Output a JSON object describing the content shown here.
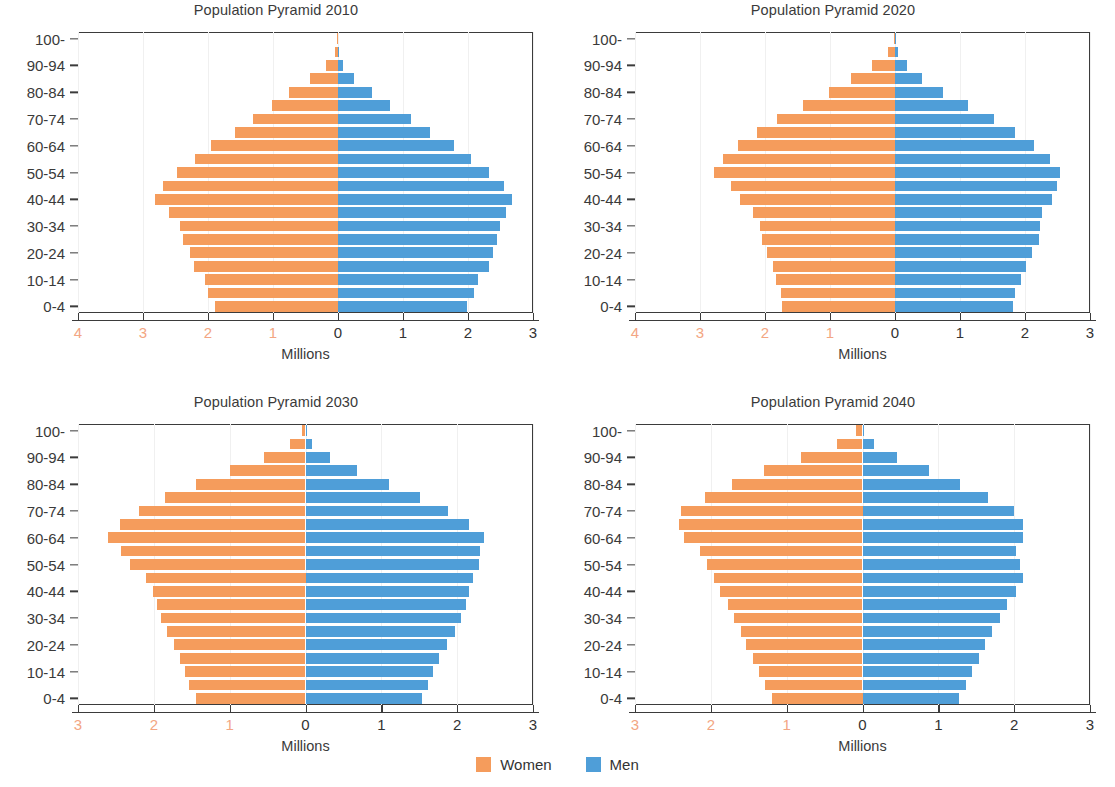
{
  "figure": {
    "legend": {
      "items": [
        {
          "label": "Women",
          "color": "#f59c5c",
          "key": "women"
        },
        {
          "label": "Men",
          "color": "#4f9ed8",
          "key": "men"
        }
      ]
    },
    "colors": {
      "women": "#f59c5c",
      "men": "#4f9ed8",
      "axis": "#3b3b3b",
      "negative_tick_label": "#f3a683",
      "positive_tick_label": "#333333",
      "text": "#3a3a3a"
    }
  },
  "chart_data": [
    {
      "type": "bar",
      "subtype": "population-pyramid",
      "title": "Population Pyramid 2010",
      "xlabel": "Millions",
      "ylabel": "",
      "grid": false,
      "legend_position": "bottom-center",
      "xlim": [
        -4,
        3
      ],
      "xticks": [
        -4,
        -3,
        -2,
        -1,
        0,
        1,
        2,
        3
      ],
      "xticklabels": [
        "4",
        "3",
        "2",
        "1",
        "0",
        "1",
        "2",
        "3"
      ],
      "categories": [
        "0-4",
        "5-9",
        "10-14",
        "15-19",
        "20-24",
        "25-29",
        "30-34",
        "35-39",
        "40-44",
        "45-49",
        "50-54",
        "55-59",
        "60-64",
        "65-69",
        "70-74",
        "75-79",
        "80-84",
        "85-89",
        "90-94",
        "95-99",
        "100+"
      ],
      "yticklabels": [
        "0-4",
        "10-14",
        "20-24",
        "30-34",
        "40-44",
        "50-54",
        "60-64",
        "70-74",
        "80-84",
        "90-94",
        "100-"
      ],
      "series": [
        {
          "name": "Women",
          "values": [
            1.9,
            2.0,
            2.05,
            2.21,
            2.28,
            2.38,
            2.43,
            2.6,
            2.81,
            2.7,
            2.48,
            2.2,
            1.95,
            1.59,
            1.31,
            1.01,
            0.76,
            0.43,
            0.18,
            0.05,
            0.01
          ]
        },
        {
          "name": "Men",
          "values": [
            1.99,
            2.09,
            2.15,
            2.32,
            2.38,
            2.45,
            2.49,
            2.59,
            2.68,
            2.56,
            2.33,
            2.05,
            1.79,
            1.42,
            1.13,
            0.8,
            0.52,
            0.24,
            0.08,
            0.02,
            0.0
          ]
        }
      ]
    },
    {
      "type": "bar",
      "subtype": "population-pyramid",
      "title": "Population Pyramid 2020",
      "xlabel": "Millions",
      "ylabel": "",
      "grid": false,
      "legend_position": "bottom-center",
      "xlim": [
        -4,
        3
      ],
      "xticks": [
        -4,
        -3,
        -2,
        -1,
        0,
        1,
        2,
        3
      ],
      "xticklabels": [
        "4",
        "3",
        "2",
        "1",
        "0",
        "1",
        "2",
        "3"
      ],
      "categories": [
        "0-4",
        "5-9",
        "10-14",
        "15-19",
        "20-24",
        "25-29",
        "30-34",
        "35-39",
        "40-44",
        "45-49",
        "50-54",
        "55-59",
        "60-64",
        "65-69",
        "70-74",
        "75-79",
        "80-84",
        "85-89",
        "90-94",
        "95-99",
        "100+"
      ],
      "yticklabels": [
        "0-4",
        "10-14",
        "20-24",
        "30-34",
        "40-44",
        "50-54",
        "60-64",
        "70-74",
        "80-84",
        "90-94",
        "100-"
      ],
      "series": [
        {
          "name": "Women",
          "values": [
            1.74,
            1.75,
            1.83,
            1.88,
            1.97,
            2.04,
            2.08,
            2.18,
            2.38,
            2.52,
            2.78,
            2.65,
            2.42,
            2.13,
            1.82,
            1.42,
            1.02,
            0.67,
            0.36,
            0.11,
            0.02
          ]
        },
        {
          "name": "Men",
          "values": [
            1.82,
            1.85,
            1.94,
            2.02,
            2.11,
            2.21,
            2.23,
            2.26,
            2.42,
            2.49,
            2.54,
            2.38,
            2.14,
            1.84,
            1.52,
            1.12,
            0.74,
            0.42,
            0.18,
            0.04,
            0.01
          ]
        }
      ]
    },
    {
      "type": "bar",
      "subtype": "population-pyramid",
      "title": "Population Pyramid 2030",
      "xlabel": "Millions",
      "ylabel": "",
      "grid": false,
      "legend_position": "bottom-center",
      "xlim": [
        -3,
        3
      ],
      "xticks": [
        -3,
        -2,
        -1,
        0,
        1,
        2,
        3
      ],
      "xticklabels": [
        "3",
        "2",
        "1",
        "0",
        "1",
        "2",
        "3"
      ],
      "categories": [
        "0-4",
        "5-9",
        "10-14",
        "15-19",
        "20-24",
        "25-29",
        "30-34",
        "35-39",
        "40-44",
        "45-49",
        "50-54",
        "55-59",
        "60-64",
        "65-69",
        "70-74",
        "75-79",
        "80-84",
        "85-89",
        "90-94",
        "95-99",
        "100+"
      ],
      "yticklabels": [
        "0-4",
        "10-14",
        "20-24",
        "30-34",
        "40-44",
        "50-54",
        "60-64",
        "70-74",
        "80-84",
        "90-94",
        "100-"
      ],
      "series": [
        {
          "name": "Women",
          "values": [
            1.44,
            1.53,
            1.59,
            1.66,
            1.74,
            1.83,
            1.9,
            1.96,
            2.01,
            2.1,
            2.31,
            2.43,
            2.61,
            2.44,
            2.19,
            1.85,
            1.45,
            0.99,
            0.55,
            0.21,
            0.04
          ]
        },
        {
          "name": "Men",
          "values": [
            1.53,
            1.62,
            1.68,
            1.76,
            1.86,
            1.97,
            2.05,
            2.11,
            2.16,
            2.21,
            2.29,
            2.3,
            2.36,
            2.16,
            1.88,
            1.51,
            1.1,
            0.68,
            0.32,
            0.09,
            0.01
          ]
        }
      ]
    },
    {
      "type": "bar",
      "subtype": "population-pyramid",
      "title": "Population Pyramid 2040",
      "xlabel": "Millions",
      "ylabel": "",
      "grid": false,
      "legend_position": "bottom-center",
      "xlim": [
        -3,
        3
      ],
      "xticks": [
        -3,
        -2,
        -1,
        0,
        1,
        2,
        3
      ],
      "xticklabels": [
        "3",
        "2",
        "1",
        "0",
        "1",
        "2",
        "3"
      ],
      "categories": [
        "0-4",
        "5-9",
        "10-14",
        "15-19",
        "20-24",
        "25-29",
        "30-34",
        "35-39",
        "40-44",
        "45-49",
        "50-54",
        "55-59",
        "60-64",
        "65-69",
        "70-74",
        "75-79",
        "80-84",
        "85-89",
        "90-94",
        "95-99",
        "100+"
      ],
      "yticklabels": [
        "0-4",
        "10-14",
        "20-24",
        "30-34",
        "40-44",
        "50-54",
        "60-64",
        "70-74",
        "80-84",
        "90-94",
        "100-"
      ],
      "series": [
        {
          "name": "Women",
          "values": [
            1.2,
            1.28,
            1.37,
            1.45,
            1.53,
            1.6,
            1.69,
            1.78,
            1.88,
            1.96,
            2.05,
            2.14,
            2.35,
            2.42,
            2.4,
            2.08,
            1.72,
            1.3,
            0.81,
            0.34,
            0.08
          ]
        },
        {
          "name": "Men",
          "values": [
            1.27,
            1.36,
            1.45,
            1.54,
            1.62,
            1.71,
            1.81,
            1.91,
            2.02,
            2.12,
            2.08,
            2.02,
            2.12,
            2.11,
            2.0,
            1.66,
            1.28,
            0.88,
            0.46,
            0.15,
            0.02
          ]
        }
      ]
    }
  ]
}
